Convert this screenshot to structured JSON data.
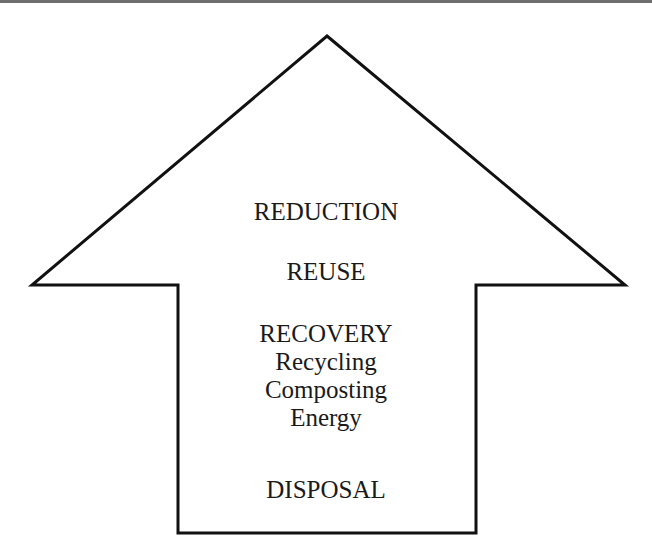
{
  "diagram": {
    "type": "waste-management-hierarchy-arrow",
    "direction": "up",
    "stroke_color": "#111111",
    "fill_color": "#ffffff",
    "text_color": "#1a1a1a",
    "levels": [
      {
        "label": "REDUCTION"
      },
      {
        "label": "REUSE"
      },
      {
        "label": "RECOVERY",
        "sub_items": [
          "Recycling",
          "Composting",
          "Energy"
        ]
      },
      {
        "label": "DISPOSAL"
      }
    ]
  }
}
